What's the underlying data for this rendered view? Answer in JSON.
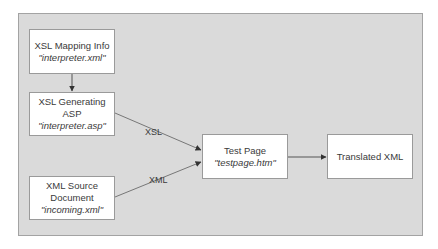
{
  "diagram": {
    "nodes": [
      {
        "id": "xsl-mapping-info",
        "title": "XSL Mapping Info",
        "file": "\"interpreter.xml\""
      },
      {
        "id": "xsl-generating-asp",
        "title": "XSL Generating ASP",
        "file": "\"interpreter.asp\""
      },
      {
        "id": "xml-source-document",
        "title": "XML Source",
        "title2": "Document",
        "file": "\"incoming.xml\""
      },
      {
        "id": "test-page",
        "title": "Test Page",
        "file": "\"testpage.htm\""
      },
      {
        "id": "translated-xml",
        "title": "Translated XML"
      }
    ],
    "edges": [
      {
        "from": "xsl-mapping-info",
        "to": "xsl-generating-asp",
        "label": ""
      },
      {
        "from": "xsl-generating-asp",
        "to": "test-page",
        "label": "XSL"
      },
      {
        "from": "xml-source-document",
        "to": "test-page",
        "label": "XML"
      },
      {
        "from": "test-page",
        "to": "translated-xml",
        "label": ""
      }
    ],
    "colors": {
      "panel": "#dadada",
      "panel_border": "#a3a3a3",
      "node_fill": "#ffffff",
      "node_border": "#9a9a9a",
      "line": "#555555",
      "text": "#3a3a3a"
    }
  }
}
